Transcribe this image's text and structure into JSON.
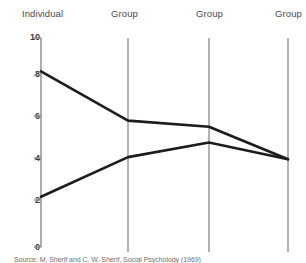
{
  "figure": {
    "ylabel": "Movement in inches",
    "source_caption": "Source: M. Sherif and C. W. Sherif, Social Psychology (1969)",
    "column_labels": [
      "Individual",
      "Group",
      "Group",
      "Group"
    ],
    "ytick_labels": [
      "10",
      "8",
      "6",
      "4",
      "2",
      "0"
    ],
    "axis_color": "#8a8a8a",
    "line_color": "#1c1c1c",
    "divider_color": "#8a8a8a"
  },
  "chart_data": {
    "type": "line",
    "title": "",
    "xlabel": "",
    "ylabel": "Movement in inches",
    "categories": [
      "Individual",
      "Group",
      "Group",
      "Group"
    ],
    "x": [
      1,
      2,
      3,
      4
    ],
    "ylim": [
      0,
      10
    ],
    "yticks": [
      0,
      2,
      4,
      6,
      8,
      10
    ],
    "grid": false,
    "legend": "none",
    "series": [
      {
        "name": "High initial estimate (converging downward)",
        "values": [
          8.4,
          6.05,
          5.75,
          4.2
        ]
      },
      {
        "name": "Low initial estimate (converging upward)",
        "values": [
          2.4,
          4.3,
          5.0,
          4.2
        ]
      }
    ],
    "annotations": [
      "Source: M. Sherif and C. W. Sherif, Social Psychology (1969)"
    ]
  }
}
